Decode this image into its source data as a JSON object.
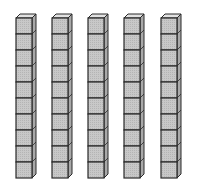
{
  "diagram": {
    "rods": 5,
    "cubes_per_rod": 10,
    "total_value": 50,
    "colors": {
      "front": "#c8c8c8",
      "side": "#a9a9a9",
      "top": "#e2e2e2",
      "stroke": "#2a2a2a",
      "background": "#ffffff"
    },
    "rod_x": [
      16,
      52,
      88,
      124,
      161
    ]
  }
}
